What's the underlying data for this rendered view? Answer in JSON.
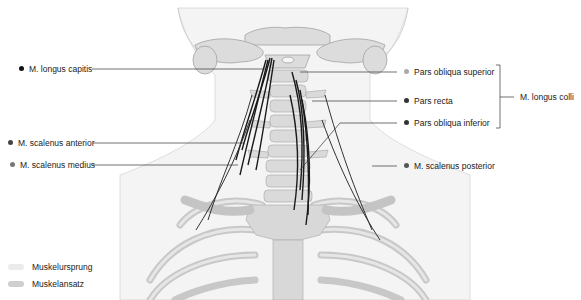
{
  "diagram": {
    "left_labels": [
      {
        "id": "longus-capitis",
        "text": "M. longus capitis",
        "dot_color": "#111111"
      },
      {
        "id": "scalenus-anterior",
        "text": "M. scalenus anterior",
        "dot_color": "#444444"
      },
      {
        "id": "scalenus-medius",
        "text": "M. scalenus medius",
        "dot_color": "#777777"
      }
    ],
    "right_labels": [
      {
        "id": "pars-obliqua-superior",
        "text": "Pars obliqua superior",
        "dot_color": "#aaaaaa"
      },
      {
        "id": "pars-recta",
        "text": "Pars recta",
        "dot_color": "#333333"
      },
      {
        "id": "pars-obliqua-inferior",
        "text": "Pars obliqua inferior",
        "dot_color": "#333333"
      },
      {
        "id": "scalenus-posterior",
        "text": "M. scalenus posterior",
        "dot_color": "#555555"
      }
    ],
    "group_label": {
      "text": "M. longus colli",
      "groups": [
        "Pars obliqua superior",
        "Pars recta",
        "Pars obliqua inferior"
      ]
    },
    "legend": [
      {
        "text": "Muskelursprung",
        "color": "#ebebeb"
      },
      {
        "text": "Muskelansatz",
        "color": "#cfcfcf"
      }
    ]
  }
}
